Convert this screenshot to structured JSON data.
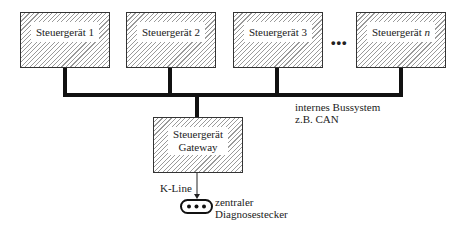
{
  "diagram": {
    "ecus": [
      {
        "label": "Steuergerät 1",
        "x": 20,
        "w": 90
      },
      {
        "label": "Steuergerät 2",
        "x": 126,
        "w": 90
      },
      {
        "label": "Steuergerät 3",
        "x": 233,
        "w": 90
      },
      {
        "label": "Steuergerät",
        "label_suffix": "n",
        "x": 356,
        "w": 90
      }
    ],
    "ellipsis": "•••",
    "bus_label_line1": "internes Bussystem",
    "bus_label_line2": "z.B. CAN",
    "gateway_line1": "Steuergerät",
    "gateway_line2": "Gateway",
    "kline_label": "K-Line",
    "connector_label_line1": "zentraler",
    "connector_label_line2": "Diagnosestecker"
  }
}
